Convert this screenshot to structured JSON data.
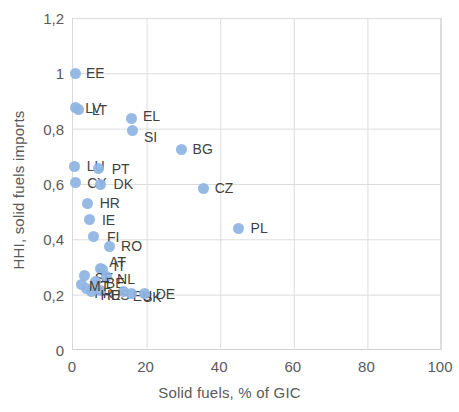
{
  "chart_data": {
    "type": "scatter",
    "title": "",
    "xlabel": "Solid fuels, % of GIC",
    "ylabel": "HHI, solid fuels imports",
    "xlim": [
      0,
      100
    ],
    "ylim": [
      0,
      1.2
    ],
    "xticks": [
      "0",
      "20",
      "40",
      "60",
      "80",
      "100"
    ],
    "xtick_values": [
      0,
      20,
      40,
      60,
      80,
      100
    ],
    "yticks": [
      "0",
      "0,2",
      "0,4",
      "0,6",
      "0,8",
      "1",
      "1,2"
    ],
    "ytick_values": [
      0,
      0.2,
      0.4,
      0.6,
      0.8,
      1.0,
      1.2
    ],
    "grid": true,
    "legend": "none",
    "marker_color": "#8EB4E3",
    "points": [
      {
        "label": "EE",
        "x": 0.8,
        "y": 1.0,
        "lx": 10,
        "ly": 0
      },
      {
        "label": "LV",
        "x": 0.6,
        "y": 0.875,
        "lx": 10,
        "ly": 0
      },
      {
        "label": "LT",
        "x": 1.6,
        "y": 0.868,
        "lx": 13,
        "ly": 0
      },
      {
        "label": "EL",
        "x": 16.0,
        "y": 0.835,
        "lx": 11,
        "ly": -3
      },
      {
        "label": "SI",
        "x": 16.3,
        "y": 0.795,
        "lx": 11,
        "ly": 7
      },
      {
        "label": "BG",
        "x": 29.5,
        "y": 0.725,
        "lx": 11,
        "ly": 0
      },
      {
        "label": "LU",
        "x": 0.5,
        "y": 0.665,
        "lx": 12,
        "ly": 0
      },
      {
        "label": "PT",
        "x": 7.0,
        "y": 0.655,
        "lx": 13,
        "ly": 0
      },
      {
        "label": "CY",
        "x": 0.6,
        "y": 0.605,
        "lx": 12,
        "ly": 0
      },
      {
        "label": "DK",
        "x": 7.5,
        "y": 0.6,
        "lx": 13,
        "ly": 0
      },
      {
        "label": "CZ",
        "x": 35.5,
        "y": 0.585,
        "lx": 11,
        "ly": 0
      },
      {
        "label": "HR",
        "x": 4.0,
        "y": 0.53,
        "lx": 12,
        "ly": 0
      },
      {
        "label": "IE",
        "x": 4.6,
        "y": 0.47,
        "lx": 12,
        "ly": 0
      },
      {
        "label": "PL",
        "x": 45.0,
        "y": 0.44,
        "lx": 12,
        "ly": 0
      },
      {
        "label": "FI",
        "x": 5.7,
        "y": 0.41,
        "lx": 13,
        "ly": 0
      },
      {
        "label": "RO",
        "x": 9.8,
        "y": 0.375,
        "lx": 12,
        "ly": 0
      },
      {
        "label": "AT",
        "x": 7.4,
        "y": 0.295,
        "lx": 9,
        "ly": -6
      },
      {
        "label": "IT",
        "x": 8.0,
        "y": 0.29,
        "lx": 11,
        "ly": -4
      },
      {
        "label": "SE",
        "x": 3.2,
        "y": 0.268,
        "lx": 10,
        "ly": 2
      },
      {
        "label": "NL",
        "x": 9.0,
        "y": 0.265,
        "lx": 11,
        "ly": 2
      },
      {
        "label": "BE",
        "x": 6.2,
        "y": 0.248,
        "lx": 10,
        "ly": 2
      },
      {
        "label": "FR",
        "x": 3.6,
        "y": 0.222,
        "lx": 8,
        "ly": 4
      },
      {
        "label": "ES",
        "x": 7.6,
        "y": 0.215,
        "lx": 10,
        "ly": 4
      },
      {
        "label": "EU",
        "x": 13.8,
        "y": 0.21,
        "lx": 9,
        "ly": 4
      },
      {
        "label": "SK",
        "x": 16.0,
        "y": 0.205,
        "lx": 11,
        "ly": 4
      },
      {
        "label": "DE",
        "x": 19.5,
        "y": 0.205,
        "lx": 11,
        "ly": 1
      },
      {
        "label": "HU",
        "x": 5.0,
        "y": 0.212,
        "lx": 9,
        "ly": 4
      },
      {
        "label": "MT",
        "x": 2.2,
        "y": 0.238,
        "lx": 8,
        "ly": 2
      }
    ]
  }
}
